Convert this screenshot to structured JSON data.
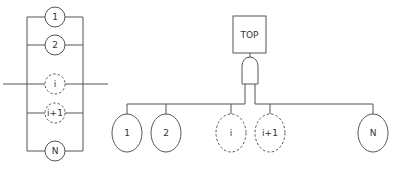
{
  "parallel_system": {
    "components": [
      {
        "label": "1",
        "style": "solid"
      },
      {
        "label": "2",
        "style": "solid"
      },
      {
        "label": "i",
        "style": "dashed"
      },
      {
        "label": "i+1",
        "style": "dashed"
      },
      {
        "label": "N",
        "style": "solid"
      }
    ]
  },
  "fault_tree": {
    "top_event": "TOP",
    "gate": "AND",
    "basic_events": [
      {
        "label": "1",
        "style": "solid"
      },
      {
        "label": "2",
        "style": "solid"
      },
      {
        "label": "i",
        "style": "dashed"
      },
      {
        "label": "i+1",
        "style": "dashed"
      },
      {
        "label": "N",
        "style": "solid"
      }
    ]
  }
}
